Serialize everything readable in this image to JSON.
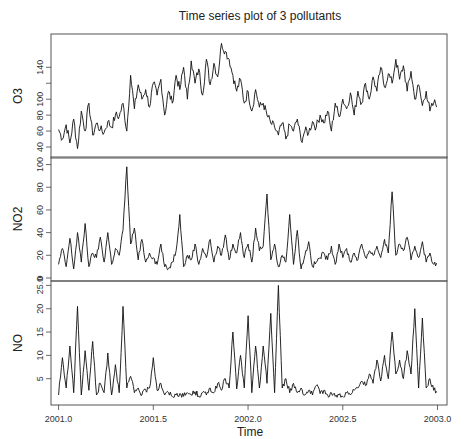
{
  "chart_data": {
    "type": "line",
    "title": "Time series plot of 3 pollutants",
    "xlabel": "Time",
    "x_ticks": [
      2001.0,
      2001.5,
      2002.0,
      2002.5,
      2003.0
    ],
    "x_tick_labels": [
      "2001.0",
      "2001.5",
      "2002.0",
      "2002.5",
      "2003.0"
    ],
    "xlim": [
      2000.96,
      2003.05
    ],
    "grid": false,
    "legend": "none",
    "panels": [
      {
        "name": "O3",
        "ylabel": "O3",
        "ylim": [
          30,
          178
        ],
        "y_ticks": [
          40,
          60,
          80,
          100,
          120,
          140
        ],
        "y_tick_labels": [
          "40",
          "60",
          "80",
          "100",
          "",
          "140"
        ],
        "top_tick_label": "",
        "x": [
          2001.0,
          2001.02,
          2001.04,
          2001.06,
          2001.08,
          2001.1,
          2001.12,
          2001.14,
          2001.16,
          2001.18,
          2001.2,
          2001.22,
          2001.24,
          2001.26,
          2001.28,
          2001.3,
          2001.32,
          2001.34,
          2001.36,
          2001.38,
          2001.4,
          2001.42,
          2001.44,
          2001.46,
          2001.48,
          2001.5,
          2001.52,
          2001.54,
          2001.56,
          2001.58,
          2001.6,
          2001.62,
          2001.64,
          2001.66,
          2001.68,
          2001.7,
          2001.72,
          2001.74,
          2001.76,
          2001.78,
          2001.8,
          2001.82,
          2001.84,
          2001.86,
          2001.88,
          2001.9,
          2001.92,
          2001.94,
          2001.96,
          2001.98,
          2002.0,
          2002.02,
          2002.04,
          2002.06,
          2002.08,
          2002.1,
          2002.12,
          2002.14,
          2002.16,
          2002.18,
          2002.2,
          2002.22,
          2002.24,
          2002.26,
          2002.28,
          2002.3,
          2002.32,
          2002.34,
          2002.36,
          2002.38,
          2002.4,
          2002.42,
          2002.44,
          2002.46,
          2002.48,
          2002.5,
          2002.52,
          2002.54,
          2002.56,
          2002.58,
          2002.6,
          2002.62,
          2002.64,
          2002.66,
          2002.68,
          2002.7,
          2002.72,
          2002.74,
          2002.76,
          2002.78,
          2002.8,
          2002.82,
          2002.84,
          2002.86,
          2002.88,
          2002.9,
          2002.92,
          2002.94,
          2002.96,
          2002.98
        ],
        "values": [
          62,
          50,
          68,
          45,
          75,
          38,
          85,
          60,
          95,
          55,
          70,
          62,
          58,
          72,
          65,
          80,
          78,
          95,
          60,
          130,
          88,
          118,
          100,
          112,
          90,
          120,
          105,
          125,
          80,
          110,
          95,
          130,
          112,
          140,
          100,
          148,
          120,
          138,
          105,
          150,
          118,
          145,
          128,
          170,
          160,
          150,
          130,
          110,
          125,
          95,
          110,
          85,
          112,
          90,
          95,
          80,
          70,
          65,
          55,
          70,
          50,
          68,
          60,
          75,
          48,
          60,
          58,
          72,
          65,
          80,
          70,
          85,
          60,
          95,
          78,
          100,
          88,
          108,
          80,
          110,
          95,
          120,
          100,
          128,
          110,
          140,
          115,
          132,
          120,
          150,
          125,
          142,
          110,
          135,
          100,
          118,
          92,
          110,
          85,
          95
        ]
      },
      {
        "name": "NO2",
        "ylabel": "NO2",
        "ylim": [
          0,
          104
        ],
        "y_ticks": [
          0,
          20,
          40,
          60,
          80,
          100
        ],
        "y_tick_labels": [
          "0",
          "20",
          "40",
          "60",
          "80",
          "100"
        ],
        "x": [
          2001.0,
          2001.02,
          2001.04,
          2001.06,
          2001.08,
          2001.1,
          2001.12,
          2001.14,
          2001.16,
          2001.18,
          2001.2,
          2001.22,
          2001.24,
          2001.26,
          2001.28,
          2001.3,
          2001.32,
          2001.34,
          2001.36,
          2001.38,
          2001.4,
          2001.42,
          2001.44,
          2001.46,
          2001.48,
          2001.5,
          2001.52,
          2001.54,
          2001.56,
          2001.58,
          2001.6,
          2001.62,
          2001.64,
          2001.66,
          2001.68,
          2001.7,
          2001.72,
          2001.74,
          2001.76,
          2001.78,
          2001.8,
          2001.82,
          2001.84,
          2001.86,
          2001.88,
          2001.9,
          2001.92,
          2001.94,
          2001.96,
          2001.98,
          2002.0,
          2002.02,
          2002.04,
          2002.06,
          2002.08,
          2002.1,
          2002.12,
          2002.14,
          2002.16,
          2002.18,
          2002.2,
          2002.22,
          2002.24,
          2002.26,
          2002.28,
          2002.3,
          2002.32,
          2002.34,
          2002.36,
          2002.38,
          2002.4,
          2002.42,
          2002.44,
          2002.46,
          2002.48,
          2002.5,
          2002.52,
          2002.54,
          2002.56,
          2002.58,
          2002.6,
          2002.62,
          2002.64,
          2002.66,
          2002.68,
          2002.7,
          2002.72,
          2002.74,
          2002.76,
          2002.78,
          2002.8,
          2002.82,
          2002.84,
          2002.86,
          2002.88,
          2002.9,
          2002.92,
          2002.94,
          2002.96,
          2002.98
        ],
        "values": [
          12,
          26,
          10,
          35,
          8,
          40,
          14,
          48,
          10,
          22,
          18,
          36,
          14,
          40,
          12,
          26,
          20,
          42,
          98,
          30,
          44,
          16,
          34,
          14,
          22,
          18,
          12,
          30,
          10,
          8,
          14,
          24,
          56,
          10,
          20,
          16,
          30,
          12,
          26,
          18,
          34,
          14,
          28,
          20,
          38,
          16,
          30,
          22,
          40,
          18,
          30,
          14,
          44,
          24,
          28,
          74,
          16,
          30,
          10,
          20,
          14,
          56,
          12,
          42,
          8,
          20,
          32,
          10,
          14,
          18,
          22,
          16,
          28,
          12,
          30,
          18,
          26,
          14,
          22,
          16,
          30,
          18,
          24,
          20,
          28,
          18,
          34,
          22,
          76,
          20,
          30,
          24,
          36,
          16,
          28,
          18,
          32,
          14,
          22,
          12
        ]
      },
      {
        "name": "NO",
        "ylabel": "NO",
        "ylim": [
          0,
          25.3
        ],
        "y_ticks": [
          5,
          10,
          15,
          20,
          25
        ],
        "y_tick_labels": [
          "5",
          "10",
          "15",
          "20",
          "25.0"
        ],
        "x": [
          2001.0,
          2001.02,
          2001.04,
          2001.06,
          2001.08,
          2001.1,
          2001.12,
          2001.14,
          2001.16,
          2001.18,
          2001.2,
          2001.22,
          2001.24,
          2001.26,
          2001.28,
          2001.3,
          2001.32,
          2001.34,
          2001.36,
          2001.38,
          2001.4,
          2001.42,
          2001.44,
          2001.46,
          2001.48,
          2001.5,
          2001.52,
          2001.54,
          2001.56,
          2001.58,
          2001.6,
          2001.62,
          2001.64,
          2001.66,
          2001.68,
          2001.7,
          2001.72,
          2001.74,
          2001.76,
          2001.78,
          2001.8,
          2001.82,
          2001.84,
          2001.86,
          2001.88,
          2001.9,
          2001.92,
          2001.94,
          2001.96,
          2001.98,
          2002.0,
          2002.02,
          2002.04,
          2002.06,
          2002.08,
          2002.1,
          2002.12,
          2002.14,
          2002.16,
          2002.18,
          2002.2,
          2002.22,
          2002.24,
          2002.26,
          2002.28,
          2002.3,
          2002.32,
          2002.34,
          2002.36,
          2002.38,
          2002.4,
          2002.42,
          2002.44,
          2002.46,
          2002.48,
          2002.5,
          2002.52,
          2002.54,
          2002.56,
          2002.58,
          2002.6,
          2002.62,
          2002.64,
          2002.66,
          2002.68,
          2002.7,
          2002.72,
          2002.74,
          2002.76,
          2002.78,
          2002.8,
          2002.82,
          2002.84,
          2002.86,
          2002.88,
          2002.9,
          2002.92,
          2002.94,
          2002.96,
          2002.98
        ],
        "values": [
          1.5,
          9.5,
          3,
          12,
          2,
          20.5,
          1.5,
          11,
          2.5,
          13,
          1.5,
          4,
          2,
          10.5,
          1.5,
          8,
          2,
          20.5,
          3,
          5.5,
          2,
          3,
          1.5,
          2.5,
          3,
          9.5,
          2.5,
          4,
          1.5,
          2,
          1.2,
          1.5,
          1.8,
          1.2,
          2,
          1.5,
          2.2,
          1.3,
          2,
          1.5,
          3,
          2,
          4,
          2.5,
          5,
          3,
          15,
          2.8,
          10,
          3,
          18.5,
          2,
          12,
          3,
          12,
          4,
          19,
          2,
          25,
          3,
          5,
          2,
          4,
          2,
          3,
          1.5,
          2.5,
          1.5,
          3.5,
          1.8,
          2.5,
          1.5,
          2,
          1.2,
          1.5,
          1.2,
          2,
          1.5,
          2.5,
          3,
          4.5,
          3.5,
          6,
          4,
          9,
          4.5,
          10,
          5,
          15,
          6,
          9,
          5,
          11,
          6,
          20,
          3,
          18,
          3,
          5,
          2.5
        ]
      }
    ]
  }
}
